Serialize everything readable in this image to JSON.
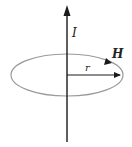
{
  "diagram": {
    "labels": {
      "current": "I",
      "field": "H",
      "radius": "r"
    },
    "colors": {
      "wire": "#1a1a1a",
      "field_line": "#9a9a9a",
      "text": "#222222"
    }
  }
}
